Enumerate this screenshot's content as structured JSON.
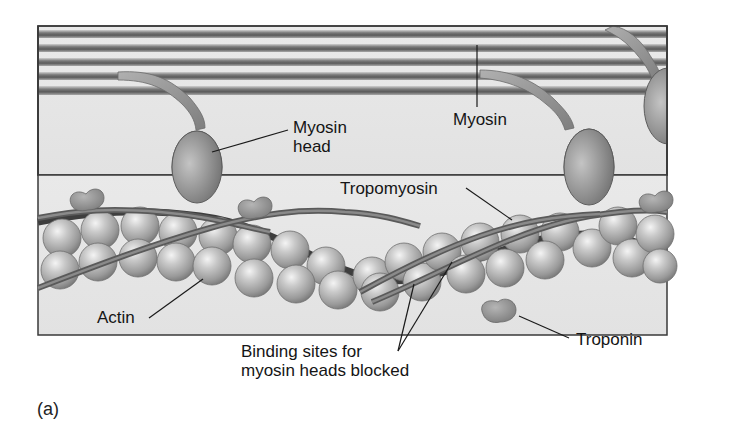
{
  "figure": {
    "panel_label": "(a)",
    "labels": {
      "myosin_head": [
        "Myosin",
        "head"
      ],
      "myosin": "Myosin",
      "tropomyosin": "Tropomyosin",
      "actin": "Actin",
      "troponin": "Troponin",
      "binding_sites": [
        "Binding sites for",
        "myosin heads blocked"
      ]
    },
    "colors": {
      "background": "#e6e6e6",
      "frame": "#3a3a3a",
      "myosin_dark": "#5a5a5a",
      "myosin_light": "#bcbcbc",
      "sphere": "#b9b9b9",
      "strand": "#6e6e6e",
      "strand_dark": "#3c3c3c",
      "troponin": "#8c8c8c"
    }
  }
}
